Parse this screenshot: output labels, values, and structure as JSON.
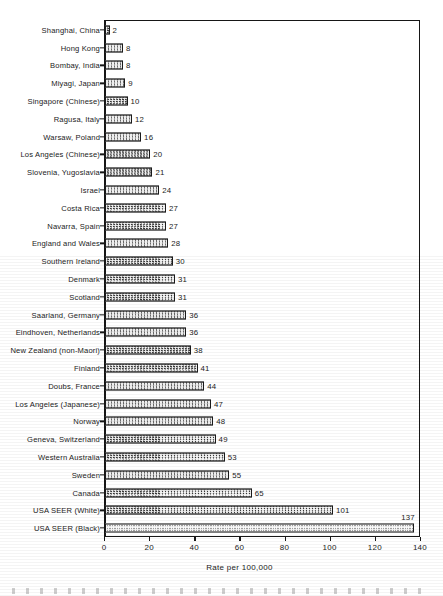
{
  "chart_data": {
    "type": "bar",
    "orientation": "horizontal",
    "title": "",
    "xlabel": "Rate per 100,000",
    "ylabel": "",
    "xlim": [
      0,
      140
    ],
    "xticks": [
      0,
      20,
      40,
      60,
      80,
      100,
      120,
      140
    ],
    "xtick_labels": [
      "0",
      "20",
      "40",
      "60",
      "80",
      "100",
      "120",
      "140"
    ],
    "grid": false,
    "legend": false,
    "categories": [
      "Shanghai, China",
      "Hong Kong",
      "Bombay, India",
      "Miyagi, Japan",
      "Singapore (Chinese)",
      "Ragusa, Italy",
      "Warsaw, Poland",
      "Los  Angeles (Chinese)",
      "Slovenia, Yugoslavia",
      "Israel",
      "Costa Rica",
      "Navarra, Spain",
      "England and Wales",
      "Southern Ireland",
      "Denmark",
      "Scotland",
      "Saarland, Germany",
      "Eindhoven, Netherlands",
      "New Zealand (non-Maori)",
      "Finland",
      "Doubs, France",
      "Los Angeles (Japanese)",
      "Norway",
      "Geneva, Switzerland",
      "Western Australia",
      "Sweden",
      "Canada",
      "USA SEER (White)",
      "USA SEER (Black)"
    ],
    "values": [
      2,
      8,
      8,
      9,
      10,
      12,
      16,
      20,
      21,
      24,
      27,
      27,
      28,
      30,
      31,
      31,
      36,
      36,
      38,
      41,
      44,
      47,
      48,
      49,
      53,
      55,
      65,
      101,
      137
    ],
    "value_labels": [
      "2",
      "8",
      "8",
      "9",
      "10",
      "12",
      "16",
      "20",
      "21",
      "24",
      "27",
      "27",
      "28",
      "30",
      "31",
      "31",
      "36",
      "36",
      "38",
      "41",
      "44",
      "47",
      "48",
      "49",
      "53",
      "55",
      "65",
      "101",
      "137"
    ],
    "bar_styles": [
      "hatched",
      "hatched",
      "hatched",
      "hatched",
      "hatched",
      "hatched",
      "hatched",
      "hatched",
      "hatched",
      "hatched",
      "hatched",
      "hatched",
      "hatched",
      "hatched",
      "hatched",
      "hatched",
      "hatched",
      "hatched",
      "hatched",
      "hatched",
      "hatched",
      "hatched",
      "hatched",
      "hatched",
      "hatched",
      "hatched",
      "hatched",
      "hatched",
      "light"
    ],
    "label_placement": [
      "right",
      "right",
      "right",
      "right",
      "right",
      "right",
      "right",
      "right",
      "right",
      "right",
      "right",
      "right",
      "right",
      "right",
      "right",
      "right",
      "right",
      "right",
      "right",
      "right",
      "right",
      "right",
      "right",
      "right",
      "right",
      "right",
      "right",
      "right",
      "above"
    ],
    "colors": {
      "bar_fill": "#8d8d8d",
      "bar_fill_light": "#d8d8d8",
      "bar_border": "#1a1a1a",
      "axis": "#161616",
      "text": "#1b1b1b",
      "background": "#ffffff"
    }
  }
}
